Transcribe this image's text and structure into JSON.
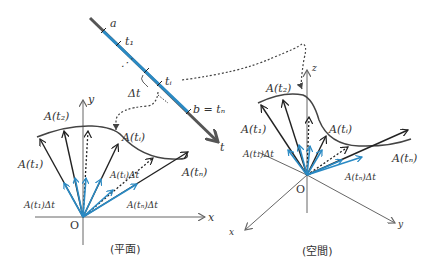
{
  "timeline": {
    "labels": {
      "a": "a",
      "t1": "t₁",
      "ti": "tᵢ",
      "b": "b = tₙ",
      "t": "t",
      "delta": "Δt"
    },
    "colors": {
      "axis": "#555555",
      "segment": "#2a8ac4"
    }
  },
  "plane": {
    "caption": "(平面)",
    "axes": {
      "x": "x",
      "y": "y",
      "origin": "O"
    },
    "vectors": {
      "A_t1": "A(t₁)",
      "A_t2": "A(t₂)",
      "A_ti": "A(tᵢ)",
      "A_tn": "A(tₙ)",
      "A_t1_dt": "A(t₁)Δt",
      "A_ti_dt": "A(tᵢ)Δt",
      "A_tn_dt": "A(tₙ)Δt"
    }
  },
  "space": {
    "caption": "(空間)",
    "axes": {
      "x": "x",
      "y": "y",
      "z": "z",
      "origin": "O"
    },
    "vectors": {
      "A_t1": "A(t₁)",
      "A_t2": "A(t₂)",
      "A_ti": "A(tᵢ)",
      "A_tn": "A(tₙ)",
      "A_t1_dt": "A(t₁)Δt",
      "A_tn_dt": "A(tₙ)Δt"
    }
  },
  "colors": {
    "vector": "#222222",
    "small_vector": "#2a8ac4",
    "axis": "#666666",
    "curve": "#444444"
  }
}
